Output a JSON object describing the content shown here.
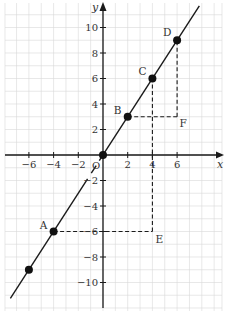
{
  "chart_data": {
    "type": "line",
    "title": "",
    "xlabel": "x",
    "ylabel": "y",
    "origin_label": "O",
    "xlim": [
      -8,
      9.5
    ],
    "ylim": [
      -11.5,
      12
    ],
    "grid": true,
    "x_ticks": [
      -6,
      -4,
      -2,
      2,
      4,
      6
    ],
    "x_tick_labels": [
      "−6",
      "−4",
      "−2",
      "2",
      "4",
      "6"
    ],
    "y_ticks": [
      10,
      8,
      6,
      4,
      2,
      -2,
      -4,
      -6,
      -8,
      -10
    ],
    "y_tick_labels": [
      "10",
      "8",
      "6",
      "4",
      "2",
      "−2",
      "−4",
      "−6",
      "−8",
      "−10"
    ],
    "line": {
      "equation": "y = 1.5x",
      "slope": 1.5,
      "intercept": 0,
      "x_range": [
        -7.5,
        7.8
      ]
    },
    "points": [
      {
        "name": "",
        "x": -6,
        "y": -9
      },
      {
        "name": "A",
        "x": -4,
        "y": -6
      },
      {
        "name": "O",
        "x": 0,
        "y": 0
      },
      {
        "name": "B",
        "x": 2,
        "y": 3
      },
      {
        "name": "C",
        "x": 4,
        "y": 6
      },
      {
        "name": "D",
        "x": 6,
        "y": 9
      }
    ],
    "auxiliary_points": [
      {
        "name": "E",
        "x": 4,
        "y": -6
      },
      {
        "name": "F",
        "x": 6,
        "y": 3
      }
    ],
    "dashed_segments": [
      {
        "from": "A",
        "to": "E"
      },
      {
        "from": "E",
        "to": "C"
      },
      {
        "from": "B",
        "to": "F"
      },
      {
        "from": "F",
        "to": "D"
      }
    ]
  }
}
